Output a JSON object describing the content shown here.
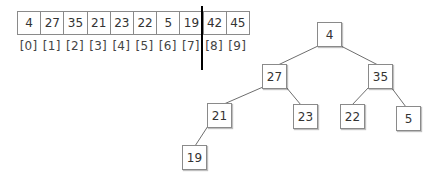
{
  "array": {
    "values": [
      "4",
      "27",
      "35",
      "21",
      "23",
      "22",
      "5",
      "19",
      "42",
      "45"
    ],
    "indices": [
      "[0]",
      "[1]",
      "[2]",
      "[3]",
      "[4]",
      "[5]",
      "[6]",
      "[7]",
      "[8]",
      "[9]"
    ],
    "divider_after_index": 7
  },
  "tree": {
    "nodes": [
      {
        "id": "n0",
        "label": "4"
      },
      {
        "id": "n1",
        "label": "27"
      },
      {
        "id": "n2",
        "label": "35"
      },
      {
        "id": "n3",
        "label": "21"
      },
      {
        "id": "n4",
        "label": "23"
      },
      {
        "id": "n5",
        "label": "22"
      },
      {
        "id": "n6",
        "label": "5"
      },
      {
        "id": "n7",
        "label": "19"
      }
    ],
    "edges": [
      [
        "4",
        "27"
      ],
      [
        "4",
        "35"
      ],
      [
        "27",
        "21"
      ],
      [
        "27",
        "23"
      ],
      [
        "35",
        "22"
      ],
      [
        "35",
        "5"
      ],
      [
        "21",
        "19"
      ]
    ]
  },
  "colors": {
    "border": "#8a8a8a",
    "divider": "#000000",
    "text": "#333333"
  }
}
